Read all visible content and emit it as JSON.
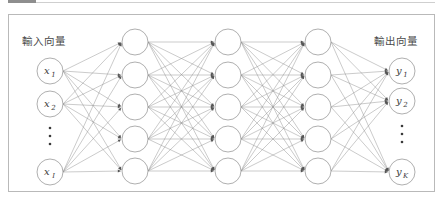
{
  "figure": {
    "type": "neural-network-diagram",
    "title": "",
    "background": "#ffffff",
    "frame_color": "#b9b9b9",
    "edge_color": "#8a8a8a",
    "node_stroke": "#9a9a9a",
    "node_fill": "#ffffff",
    "text_color": "#3a3a3a",
    "label_color": "#4a4a4a"
  },
  "labels": {
    "input_vector": "輸入向量",
    "output_vector": "輸出向量"
  },
  "layers": [
    {
      "id": "input",
      "name": "input-layer",
      "x": 50,
      "radius": 13,
      "nodes": [
        {
          "base": "x",
          "sub": "1",
          "y": 71,
          "kind": "node"
        },
        {
          "base": "x",
          "sub": "2",
          "y": 104,
          "kind": "node"
        },
        {
          "base": "",
          "sub": "",
          "y": 136,
          "kind": "ellipsis"
        },
        {
          "base": "x",
          "sub": "I",
          "y": 172,
          "kind": "node"
        }
      ]
    },
    {
      "id": "hidden1",
      "name": "hidden-layer-1",
      "x": 135,
      "radius": 13,
      "nodes": [
        {
          "base": "",
          "sub": "",
          "y": 42,
          "kind": "node"
        },
        {
          "base": "",
          "sub": "",
          "y": 75,
          "kind": "node"
        },
        {
          "base": "",
          "sub": "",
          "y": 107,
          "kind": "node"
        },
        {
          "base": "",
          "sub": "",
          "y": 139,
          "kind": "node"
        },
        {
          "base": "",
          "sub": "",
          "y": 171,
          "kind": "node"
        }
      ]
    },
    {
      "id": "hidden2",
      "name": "hidden-layer-2",
      "x": 228,
      "radius": 13,
      "nodes": [
        {
          "base": "",
          "sub": "",
          "y": 42,
          "kind": "node"
        },
        {
          "base": "",
          "sub": "",
          "y": 75,
          "kind": "node"
        },
        {
          "base": "",
          "sub": "",
          "y": 107,
          "kind": "node"
        },
        {
          "base": "",
          "sub": "",
          "y": 139,
          "kind": "node"
        },
        {
          "base": "",
          "sub": "",
          "y": 171,
          "kind": "node"
        }
      ]
    },
    {
      "id": "hidden3",
      "name": "hidden-layer-3",
      "x": 318,
      "radius": 13,
      "nodes": [
        {
          "base": "",
          "sub": "",
          "y": 42,
          "kind": "node"
        },
        {
          "base": "",
          "sub": "",
          "y": 75,
          "kind": "node"
        },
        {
          "base": "",
          "sub": "",
          "y": 107,
          "kind": "node"
        },
        {
          "base": "",
          "sub": "",
          "y": 139,
          "kind": "node"
        },
        {
          "base": "",
          "sub": "",
          "y": 171,
          "kind": "node"
        }
      ]
    },
    {
      "id": "output",
      "name": "output-layer",
      "x": 402,
      "radius": 13,
      "nodes": [
        {
          "base": "y",
          "sub": "1",
          "y": 71,
          "kind": "node"
        },
        {
          "base": "y",
          "sub": "2",
          "y": 101,
          "kind": "node"
        },
        {
          "base": "",
          "sub": "",
          "y": 134,
          "kind": "ellipsis"
        },
        {
          "base": "y",
          "sub": "K",
          "y": 172,
          "kind": "node"
        }
      ]
    }
  ],
  "ellipsis": {
    "count": 3,
    "spacing": 8,
    "radius": 1.3
  }
}
